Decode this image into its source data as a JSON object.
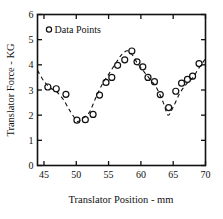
{
  "chart_data": {
    "type": "scatter",
    "title": "",
    "xlabel": "Translator Position - mm",
    "ylabel": "Translator Force - KG",
    "xlim": [
      44,
      70
    ],
    "ylim": [
      0,
      6
    ],
    "xticks": [
      45,
      50,
      55,
      60,
      65,
      70
    ],
    "yticks": [
      0,
      1,
      2,
      3,
      4,
      5,
      6
    ],
    "xtick_labels": [
      "45",
      "50",
      "55",
      "60",
      "65",
      "70"
    ],
    "ytick_labels": [
      "0",
      "1",
      "2",
      "3",
      "4",
      "5",
      "6"
    ],
    "grid": false,
    "legend": {
      "position": "top-left-inside",
      "entries": [
        {
          "label": "Data Points",
          "marker": "open-circle"
        }
      ]
    },
    "series": [
      {
        "name": "Data Points",
        "marker": "open-circle",
        "line_style": "dashed",
        "x": [
          45.6,
          46.9,
          48.4,
          50.1,
          51.4,
          52.6,
          53.6,
          54.6,
          55.5,
          56.4,
          57.5,
          58.6,
          59.4,
          60.3,
          61.1,
          62.1,
          63.0,
          64.3,
          65.4,
          66.3,
          67.2,
          68.0,
          69.0
        ],
        "y": [
          3.12,
          3.05,
          2.83,
          1.8,
          1.82,
          2.03,
          2.8,
          3.3,
          3.5,
          3.98,
          4.2,
          4.55,
          4.12,
          3.92,
          3.5,
          3.33,
          2.82,
          2.3,
          2.95,
          3.27,
          3.42,
          3.55,
          4.05
        ]
      }
    ],
    "trend_line": {
      "style": "dashed",
      "x": [
        44.0,
        45.0,
        46.0,
        47.0,
        48.0,
        49.0,
        50.0,
        50.4,
        51.0,
        52.0,
        53.0,
        54.0,
        55.0,
        56.0,
        57.0,
        57.9,
        58.6,
        59.5,
        60.5,
        61.5,
        62.5,
        63.5,
        64.2,
        65.0,
        66.0,
        67.0,
        68.0,
        69.0,
        70.0
      ],
      "y": [
        3.78,
        3.35,
        3.08,
        2.92,
        2.62,
        2.18,
        1.8,
        1.76,
        1.88,
        2.1,
        2.68,
        3.22,
        3.62,
        4.02,
        4.4,
        4.56,
        4.42,
        4.05,
        3.72,
        3.4,
        3.05,
        2.48,
        2.0,
        2.32,
        2.86,
        3.22,
        3.48,
        3.88,
        4.25
      ]
    },
    "marker_style": {
      "shape": "circle",
      "fill": "none",
      "stroke": "#111111",
      "radius_px": 3.0
    },
    "axis_color": "#111111",
    "background": "#ffffff"
  }
}
